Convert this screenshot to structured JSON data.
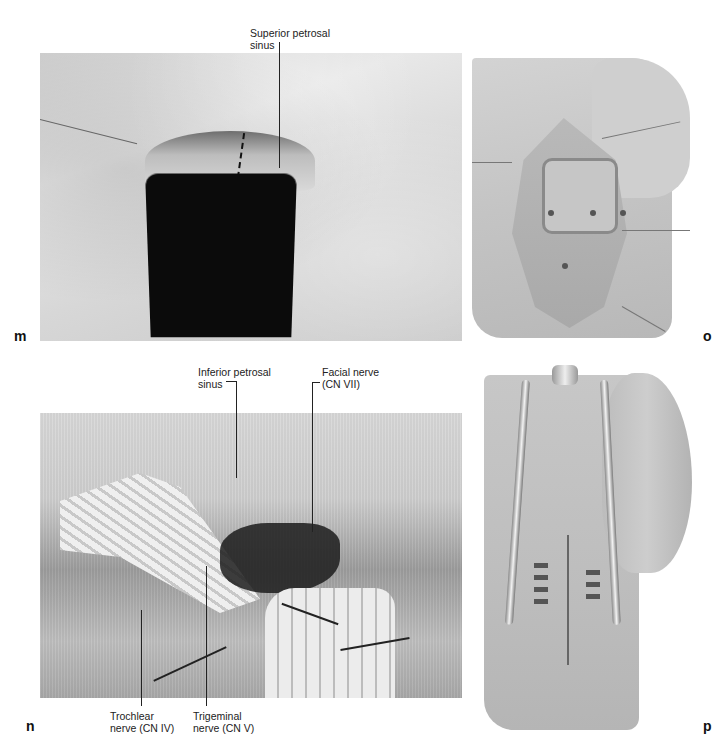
{
  "figure": {
    "panels": [
      {
        "id": "m",
        "letter": "m",
        "labels": [
          {
            "text_line1": "Superior petrosal",
            "text_line2": "sinus"
          }
        ]
      },
      {
        "id": "o",
        "letter": "o",
        "labels": []
      },
      {
        "id": "n",
        "letter": "n",
        "labels": [
          {
            "text_line1": "Inferior petrosal",
            "text_line2": "sinus"
          },
          {
            "text_line1": "Facial nerve",
            "text_line2": "(CN VII)"
          },
          {
            "text_line1": "Trochlear",
            "text_line2": "nerve (CN IV)"
          },
          {
            "text_line1": "Trigeminal",
            "text_line2": "nerve (CN V)"
          }
        ]
      },
      {
        "id": "p",
        "letter": "p",
        "labels": []
      }
    ]
  }
}
